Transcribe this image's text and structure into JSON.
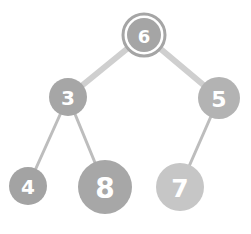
{
  "tree": {
    "type": "binary-tree",
    "colors": {
      "node_dark": "#9e9e9e",
      "node_light": "#c4c4c4",
      "edge": "#cfcfcf",
      "edge_left_lower": "#bdbdbd",
      "label": "#ffffff"
    },
    "nodes": [
      {
        "id": "n6",
        "label": "6",
        "cx": 144,
        "cy": 35,
        "r": 17,
        "fill": "#a5a5a5",
        "highlighted": true
      },
      {
        "id": "n3",
        "label": "3",
        "cx": 68,
        "cy": 97,
        "r": 19,
        "fill": "#a6a6a6",
        "highlighted": false
      },
      {
        "id": "n5",
        "label": "5",
        "cx": 219,
        "cy": 98,
        "r": 21,
        "fill": "#b3b3b3",
        "highlighted": false
      },
      {
        "id": "n4",
        "label": "4",
        "cx": 28,
        "cy": 186,
        "r": 19,
        "fill": "#a3a3a3",
        "highlighted": false
      },
      {
        "id": "n8",
        "label": "8",
        "cx": 105,
        "cy": 187,
        "r": 27,
        "fill": "#a7a7a7",
        "highlighted": false
      },
      {
        "id": "n7",
        "label": "7",
        "cx": 180,
        "cy": 187,
        "r": 24,
        "fill": "#c6c6c6",
        "highlighted": false
      }
    ],
    "edges": [
      {
        "from": "n6",
        "to": "n3",
        "width": 6
      },
      {
        "from": "n6",
        "to": "n5",
        "width": 6
      },
      {
        "from": "n3",
        "to": "n4",
        "width": 3
      },
      {
        "from": "n3",
        "to": "n8",
        "width": 3
      },
      {
        "from": "n5",
        "to": "n7",
        "width": 3
      }
    ]
  }
}
